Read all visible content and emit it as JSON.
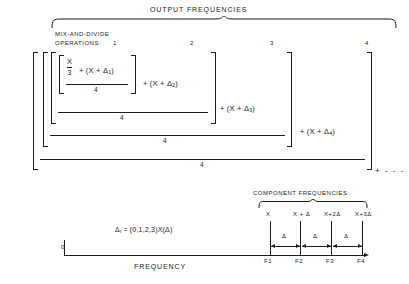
{
  "diagram": {
    "title": "OUTPUT FREQUENCIES",
    "operations_label_line1": "MIX-AND-DIVIDE",
    "operations_label_line2": "OPERATIONS:",
    "operation_numbers": [
      "1",
      "2",
      "3",
      "4"
    ],
    "inner_fraction": {
      "numerator": "X",
      "denominator": "3"
    },
    "inner_term": "+ (X + Δ",
    "inner_term_sub": "1",
    "inner_term_close": ")",
    "terms": [
      {
        "text": "+ (X + Δ",
        "sub": "2",
        "close": ")"
      },
      {
        "text": "+ (X + Δ",
        "sub": "3",
        "close": ")"
      },
      {
        "text": "+ (X + Δ",
        "sub": "4",
        "close": ")"
      }
    ],
    "divisors": [
      "4",
      "4",
      "4",
      "4"
    ],
    "continuation": "+ - - -",
    "delta_equation": {
      "symbol": "Δ",
      "subscript": "i",
      "equals": "= (0,1,2,3)X(Δ)"
    },
    "axis": {
      "origin": "0",
      "label": "FREQUENCY"
    },
    "component_section": {
      "title": "COMPONENT FREQUENCIES",
      "frequency_expressions": [
        "X",
        "X + Δ",
        "X+2Δ",
        "X+3Δ"
      ],
      "tick_labels": [
        "F1",
        "F2",
        "F3",
        "F4"
      ],
      "spacing_labels": [
        "Δ",
        "Δ",
        "Δ"
      ]
    }
  },
  "colors": {
    "ink": "#1a1a1a",
    "background": "#ffffff"
  }
}
